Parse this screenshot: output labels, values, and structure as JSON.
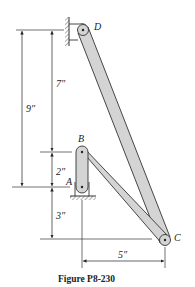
{
  "figure": {
    "caption": "Figure P8-230",
    "points": {
      "A": "A",
      "B": "B",
      "C": "C",
      "D": "D"
    },
    "dimensions": {
      "total_height": "9″",
      "upper_height": "7″",
      "link_ab_height": "2″",
      "lower_height": "3″",
      "horizontal_offset": "5″"
    },
    "colors": {
      "link_fill": "#d4d4d4",
      "stroke": "#333333",
      "background": "#ffffff"
    }
  }
}
